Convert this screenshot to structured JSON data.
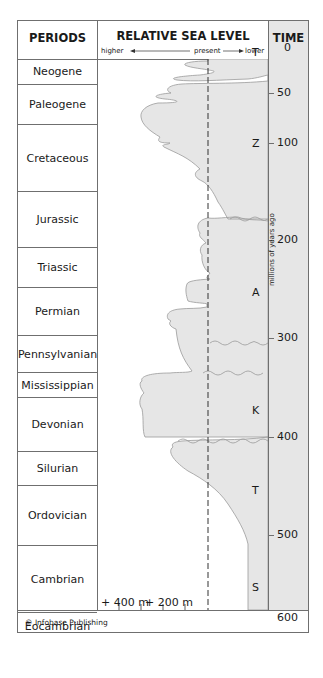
{
  "header": {
    "periods": "PERIODS",
    "sea_level": "RELATIVE SEA LEVEL",
    "time": "TIME",
    "direction_higher": "higher",
    "direction_present": "present",
    "direction_lower": "lower"
  },
  "periods": [
    {
      "name": "Neogene",
      "top": 38,
      "height": 26
    },
    {
      "name": "Paleogene",
      "top": 64,
      "height": 40
    },
    {
      "name": "Cretaceous",
      "top": 104,
      "height": 67
    },
    {
      "name": "Jurassic",
      "top": 171,
      "height": 56
    },
    {
      "name": "Triassic",
      "top": 227,
      "height": 40
    },
    {
      "name": "Permian",
      "top": 267,
      "height": 48
    },
    {
      "name": "Pennsylvanian",
      "top": 315,
      "height": 37
    },
    {
      "name": "Mississippian",
      "top": 352,
      "height": 25
    },
    {
      "name": "Devonian",
      "top": 377,
      "height": 54
    },
    {
      "name": "Silurian",
      "top": 431,
      "height": 34
    },
    {
      "name": "Ordovician",
      "top": 465,
      "height": 60
    },
    {
      "name": "Cambrian",
      "top": 525,
      "height": 67
    },
    {
      "name": "Eocambrian",
      "top": 592,
      "height": 27
    }
  ],
  "time_ticks": [
    {
      "label": "0",
      "y": 40
    },
    {
      "label": "50",
      "y": 85
    },
    {
      "label": "100",
      "y": 135
    },
    {
      "label": "200",
      "y": 232
    },
    {
      "label": "300",
      "y": 330
    },
    {
      "label": "400",
      "y": 429
    },
    {
      "label": "500",
      "y": 527
    },
    {
      "label": "600",
      "y": 610
    }
  ],
  "time_axis_label": "millions of years ago",
  "zones": [
    {
      "label": "T",
      "y": 45
    },
    {
      "label": "Z",
      "y": 136
    },
    {
      "label": "A",
      "y": 285
    },
    {
      "label": "K",
      "y": 403
    },
    {
      "label": "T",
      "y": 483
    },
    {
      "label": "S",
      "y": 580
    }
  ],
  "scale": {
    "label_400": "+ 400 m",
    "label_200": "+ 200 m"
  },
  "footer": "© Infobase Publishing",
  "colors": {
    "fill": "#e6e6e6",
    "border": "#6f6f6f",
    "curve": "#9a9a9a"
  },
  "chart_data": {
    "type": "area",
    "title": "RELATIVE SEA LEVEL",
    "xlabel": "Relative sea level (higher ← present → lower)",
    "ylabel": "TIME (millions of years ago)",
    "ylim": [
      0,
      600
    ],
    "y_ticks": [
      0,
      50,
      100,
      200,
      300,
      400,
      500,
      600
    ],
    "x_scale_labels": [
      "+ 400 m",
      "+ 200 m"
    ],
    "periods": [
      "Neogene",
      "Paleogene",
      "Cretaceous",
      "Jurassic",
      "Triassic",
      "Permian",
      "Pennsylvanian",
      "Mississippian",
      "Devonian",
      "Silurian",
      "Ordovician",
      "Cambrian",
      "Eocambrian"
    ],
    "sequences": [
      "T",
      "Z",
      "A",
      "K",
      "T",
      "S"
    ],
    "sequence_boundaries_ma": [
      30,
      190,
      320,
      400,
      490
    ],
    "annotations": [
      "millions of years ago",
      "© Infobase Publishing"
    ]
  }
}
